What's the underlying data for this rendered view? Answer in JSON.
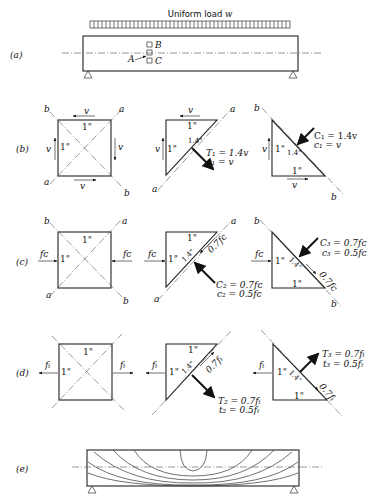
{
  "figure": {
    "panels": [
      {
        "id": "a",
        "label": "(a)",
        "load_label": "Uniform load",
        "load_symbol": "w",
        "points": [
          "A",
          "B",
          "C"
        ]
      },
      {
        "id": "b",
        "label": "(b)",
        "stress": "v",
        "element": {
          "side": "1\"",
          "diag_a": "a",
          "diag_b": "b"
        },
        "tension_result": {
          "force": "T₁ = 1.4v",
          "stress": "t₁ = v",
          "hyp": "1.4\""
        },
        "compression_result": {
          "force": "C₁ = 1.4v",
          "stress": "c₁ = v",
          "hyp": "1.4\""
        }
      },
      {
        "id": "c",
        "label": "(c)",
        "stress": "fᴄ",
        "compression_a": {
          "force": "C₂ = 0.7fᴄ",
          "stress": "c₂ = 0.5fᴄ",
          "shear": "0.7fᴄ",
          "hyp": "1.4\""
        },
        "compression_b": {
          "force": "C₃ = 0.7fᴄ",
          "stress": "c₃ = 0.5fᴄ",
          "shear": "0.7fᴄ",
          "hyp": "1.4\""
        }
      },
      {
        "id": "d",
        "label": "(d)",
        "stress": "fₜ",
        "tension_a": {
          "force": "T₂ = 0.7fₜ",
          "stress": "t₂ = 0.5fₜ",
          "shear": "0.7fₜ",
          "hyp": "1.4\""
        },
        "tension_b": {
          "force": "T₃ = 0.7fₜ",
          "stress": "t₃ = 0.5fₜ",
          "shear": "0.7fₜ",
          "hyp": "1.4\""
        }
      },
      {
        "id": "e",
        "label": "(e)",
        "description": "stress trajectories in beam"
      }
    ],
    "unit_side": "1\"",
    "hyp_label": "1.4\"",
    "labels": {
      "a": "a",
      "b": "b",
      "v": "v",
      "fc": "fᴄ",
      "ft": "fₜ"
    }
  }
}
